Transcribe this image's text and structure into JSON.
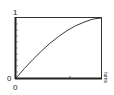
{
  "chart_data": {
    "type": "line",
    "title": "",
    "xlabel": "turns",
    "ylabel": "",
    "x_ticks": [
      "0"
    ],
    "y_ticks": [
      "0",
      "1"
    ],
    "xlim": [
      0,
      1
    ],
    "ylim": [
      0,
      1
    ],
    "grid": false,
    "series": [
      {
        "name": "curve",
        "x": [
          0,
          0.1,
          0.2,
          0.3,
          0.4,
          0.5,
          0.6,
          0.7,
          0.8,
          0.9,
          1.0
        ],
        "y": [
          0,
          0.16,
          0.31,
          0.45,
          0.58,
          0.69,
          0.79,
          0.87,
          0.93,
          0.98,
          1.0
        ]
      }
    ]
  },
  "labels": {
    "y_top": "1",
    "y_bottom": "0",
    "x_origin": "0",
    "x_axis": "turns"
  }
}
